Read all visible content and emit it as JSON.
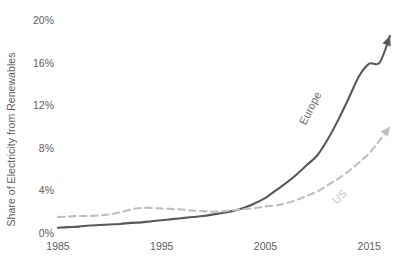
{
  "chart_data": {
    "type": "line",
    "title": "",
    "subtitle": "",
    "xlabel": "",
    "ylabel": "Share of Electricity from Renewables",
    "xlim": [
      1985,
      2017
    ],
    "ylim": [
      0,
      20
    ],
    "grid": false,
    "legend_position": "inline-annotations",
    "x_tick_labels": [
      "1985",
      "1995",
      "2005",
      "2015"
    ],
    "x_tick_values": [
      1985,
      1995,
      2005,
      2015
    ],
    "y_tick_labels": [
      "0%",
      "4%",
      "8%",
      "12%",
      "16%",
      "20%"
    ],
    "y_tick_values": [
      0,
      4,
      8,
      12,
      16,
      20
    ],
    "y_unit": "%",
    "annotations": [
      {
        "text": "Europe",
        "series": "Europe",
        "rotation_deg": -63
      },
      {
        "text": "US",
        "series": "US",
        "rotation_deg": -45
      }
    ],
    "series": [
      {
        "name": "Europe",
        "color": "#595959",
        "style": "solid",
        "arrow_end": true,
        "x": [
          1985,
          1986,
          1987,
          1988,
          1989,
          1990,
          1991,
          1992,
          1993,
          1994,
          1995,
          1996,
          1997,
          1998,
          1999,
          2000,
          2001,
          2002,
          2003,
          2004,
          2005,
          2006,
          2007,
          2008,
          2009,
          2010,
          2011,
          2012,
          2013,
          2014,
          2015,
          2016,
          2017
        ],
        "values": [
          0.5,
          0.55,
          0.6,
          0.7,
          0.75,
          0.8,
          0.85,
          0.95,
          1.0,
          1.1,
          1.2,
          1.3,
          1.4,
          1.5,
          1.6,
          1.75,
          1.9,
          2.1,
          2.4,
          2.8,
          3.3,
          4.0,
          4.7,
          5.5,
          6.4,
          7.3,
          8.8,
          10.6,
          12.6,
          14.7,
          15.9,
          16.0,
          18.5
        ]
      },
      {
        "name": "US",
        "color": "#bfbfbf",
        "style": "dashed",
        "arrow_end": true,
        "x": [
          1985,
          1986,
          1987,
          1988,
          1989,
          1990,
          1991,
          1992,
          1993,
          1994,
          1995,
          1996,
          1997,
          1998,
          1999,
          2000,
          2001,
          2002,
          2003,
          2004,
          2005,
          2006,
          2007,
          2008,
          2009,
          2010,
          2011,
          2012,
          2013,
          2014,
          2015,
          2016,
          2017
        ],
        "values": [
          1.5,
          1.55,
          1.6,
          1.6,
          1.65,
          1.75,
          1.95,
          2.2,
          2.35,
          2.35,
          2.3,
          2.25,
          2.2,
          2.1,
          2.05,
          2.0,
          2.05,
          2.15,
          2.25,
          2.35,
          2.5,
          2.6,
          2.8,
          3.1,
          3.5,
          3.9,
          4.5,
          5.1,
          5.8,
          6.6,
          7.5,
          8.7,
          10.0
        ]
      }
    ]
  },
  "axis": {
    "y_title": "Share of Electricity from Renewables"
  }
}
